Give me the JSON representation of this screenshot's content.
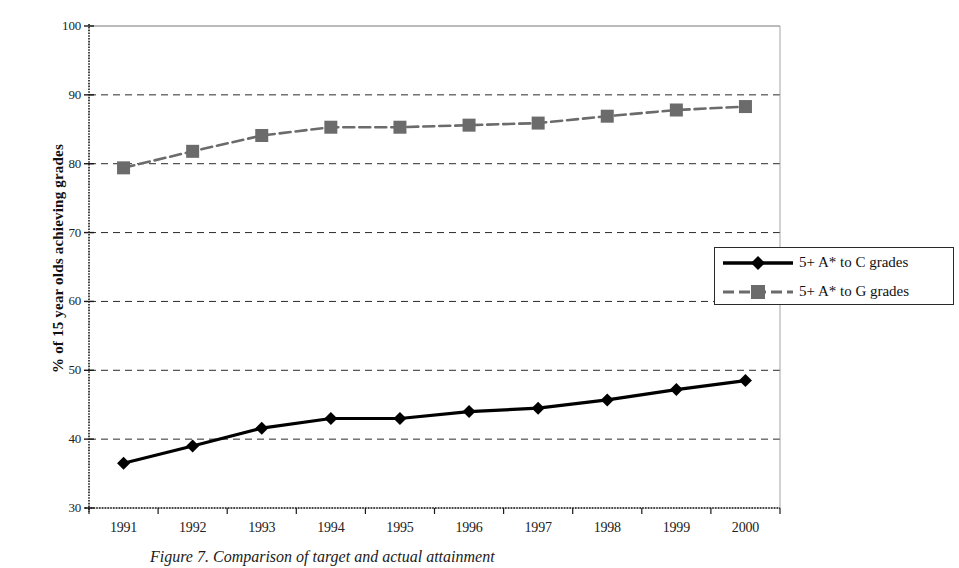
{
  "figure": {
    "caption": "Figure 7. Comparison of target and actual attainment",
    "y_axis_title": "% of 15 year olds achieving grades"
  },
  "legend": {
    "entries": [
      {
        "label": "5+ A* to C grades",
        "marker": "diamond",
        "color": "#000000",
        "dash": "solid"
      },
      {
        "label": "5+ A* to G grades",
        "marker": "square",
        "color": "#6b6b6b",
        "dash": "dashed"
      }
    ]
  },
  "chart_data": {
    "type": "line",
    "title": "",
    "xlabel": "",
    "ylabel": "% of 15 year olds achieving grades",
    "categories": [
      "1991",
      "1992",
      "1993",
      "1994",
      "1995",
      "1996",
      "1997",
      "1998",
      "1999",
      "2000"
    ],
    "ylim": [
      30,
      100
    ],
    "yticks": [
      30,
      40,
      50,
      60,
      70,
      80,
      90,
      100
    ],
    "ytick_labels": [
      "30",
      "40",
      "50",
      "60",
      "70",
      "80",
      "90",
      "100"
    ],
    "grid": "horizontal-dashed",
    "legend_position": "right-middle",
    "series": [
      {
        "name": "5+ A* to C grades",
        "color": "#000000",
        "marker": "diamond",
        "dash": "solid",
        "values": [
          36.5,
          39.0,
          41.6,
          43.0,
          43.0,
          44.0,
          44.5,
          45.7,
          47.2,
          48.5
        ]
      },
      {
        "name": "5+ A* to G grades",
        "color": "#6b6b6b",
        "marker": "square",
        "dash": "dashed",
        "values": [
          79.4,
          81.8,
          84.1,
          85.3,
          85.3,
          85.6,
          85.9,
          86.9,
          87.8,
          88.3
        ]
      }
    ]
  }
}
